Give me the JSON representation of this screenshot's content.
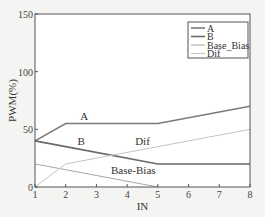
{
  "chart_data": {
    "type": "line",
    "title": "",
    "xlabel": "IN",
    "ylabel": "PWM(%)",
    "xlim": [
      1,
      8
    ],
    "ylim": [
      0,
      150
    ],
    "xticks": [
      1,
      2,
      3,
      4,
      5,
      6,
      7,
      8
    ],
    "yticks": [
      0,
      50,
      100,
      150
    ],
    "grid": false,
    "legend_position": "upper right",
    "series": [
      {
        "name": "A",
        "color": "#7a7a7a",
        "width": 1.6,
        "x": [
          1,
          2,
          5,
          8
        ],
        "y": [
          40,
          55,
          55,
          70
        ]
      },
      {
        "name": "B",
        "color": "#6a6a6a",
        "width": 1.6,
        "x": [
          1,
          2,
          5,
          8
        ],
        "y": [
          40,
          35,
          20,
          20
        ]
      },
      {
        "name": "Base_Bias",
        "color": "#a8a8a8",
        "width": 1.0,
        "x": [
          1,
          2,
          5
        ],
        "y": [
          20,
          15,
          0
        ]
      },
      {
        "name": "Dif",
        "color": "#c4c4c4",
        "width": 1.0,
        "x": [
          1,
          2,
          5,
          8
        ],
        "y": [
          0,
          20,
          35,
          50
        ]
      }
    ],
    "annotations": [
      {
        "text": "A",
        "x": 2.6,
        "y": 58
      },
      {
        "text": "B",
        "x": 2.5,
        "y": 36
      },
      {
        "text": "Dif",
        "x": 4.5,
        "y": 36
      },
      {
        "text": "Base-Bias",
        "x": 4.2,
        "y": 11
      }
    ]
  }
}
